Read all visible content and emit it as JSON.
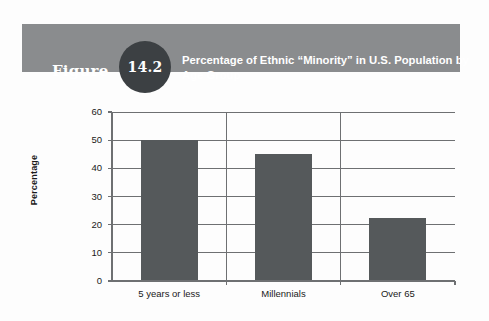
{
  "figure": {
    "label": "Figure",
    "number": "14.2",
    "title": "Percentage of Ethnic “Minority” in U.S. Population by Age Group",
    "header_bg": "#8a8c8e",
    "circle_bg": "#3c4043",
    "header_text_color": "#ffffff"
  },
  "chart_data": {
    "type": "bar",
    "title": "Percentage of Ethnic “Minority” in U.S. Population by Age Group",
    "categories": [
      "5 years or less",
      "Millennials",
      "Over 65"
    ],
    "values": [
      50,
      45,
      22.5
    ],
    "xlabel": "",
    "ylabel": "Percentage",
    "ylim": [
      0,
      60
    ],
    "yticks": [
      0,
      10,
      20,
      30,
      40,
      50,
      60
    ],
    "ytick_labels": [
      "0",
      "10",
      "20",
      "30",
      "40",
      "50",
      "60"
    ],
    "grid": true,
    "grid_axis": "y",
    "legend": false,
    "bar_color": "#55595b",
    "axis_color": "#6e7072",
    "background": "#fdfdfd"
  }
}
